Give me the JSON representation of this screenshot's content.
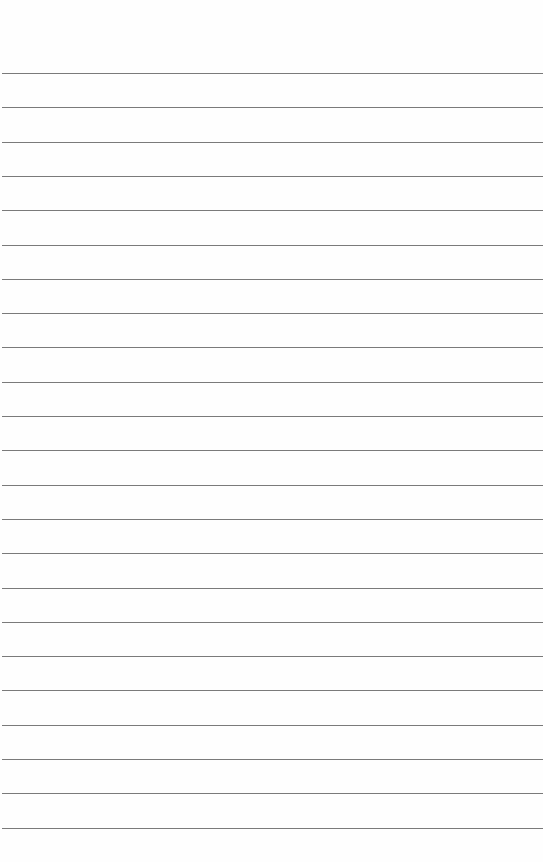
{
  "paper": {
    "type": "lined-notepad",
    "line_color": "#7a7a7a",
    "background": "#fefefe",
    "first_line_y": 73,
    "line_spacing": 34.3,
    "line_count": 23
  }
}
